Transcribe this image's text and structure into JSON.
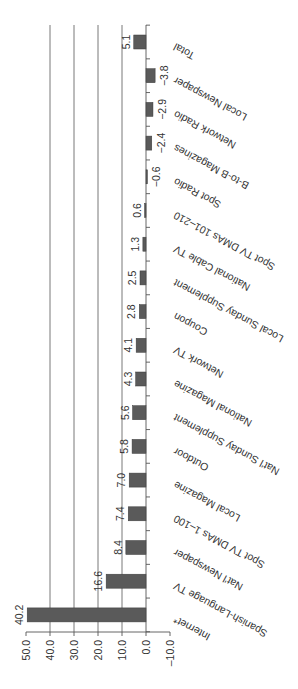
{
  "chart_data": {
    "type": "bar",
    "orientation": "rotated (horizontal bars, image rotated)",
    "title": "",
    "xlabel": "",
    "ylabel": "",
    "ylim": [
      -10,
      50
    ],
    "grid": true,
    "gridlines_at": [
      20,
      30,
      40,
      10
    ],
    "tick_labels": [
      "50.0",
      "40.0",
      "30.0",
      "20.0",
      "10.0",
      "0.0",
      "–10.0"
    ],
    "ticks": [
      50,
      40,
      30,
      20,
      10,
      0,
      -10
    ],
    "categories": [
      "Total",
      "Local Newspaper",
      "Network Radio",
      "B-to-B Magazines",
      "Spot Radio",
      "Spot TV DMAs 101–210",
      "National Cable TV",
      "Local Sunday Supplement",
      "Coupon",
      "Network TV",
      "National Magazine",
      "Nat'l Sunday Supplement",
      "Outdoor",
      "Local Magazine",
      "Spot TV DMAs 1–100",
      "Nat'l Newspaper",
      "Spanish-Language TV",
      "Internet*"
    ],
    "values": [
      5.1,
      -3.8,
      -2.9,
      -2.4,
      -0.6,
      0.6,
      1.3,
      2.5,
      2.8,
      4.1,
      4.3,
      5.6,
      5.8,
      7.0,
      7.4,
      8.4,
      16.6,
      40.2
    ],
    "value_labels": [
      "5.1",
      "−3.8",
      "−2.9",
      "−2.4",
      "−0.6",
      "0.6",
      "1.3",
      "2.5",
      "2.8",
      "4.1",
      "4.3",
      "5.6",
      "5.8",
      "7.0",
      "7.4",
      "8.4",
      "16.6",
      "40.2"
    ],
    "drawn_lengths": [
      5.1,
      -3.8,
      -2.9,
      -2.4,
      -0.6,
      0.6,
      1.3,
      2.5,
      2.8,
      4.1,
      4.3,
      5.6,
      5.8,
      7.0,
      7.4,
      8.4,
      16.6,
      49.5
    ]
  }
}
